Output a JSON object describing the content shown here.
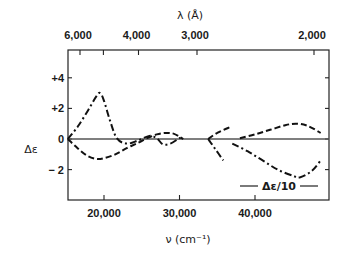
{
  "chart_data": {
    "type": "line",
    "title": "",
    "xlabel": "ν (cm⁻¹)",
    "ylabel": "Δε",
    "top_xlabel": "λ (Å)",
    "xlim": [
      15200,
      49700
    ],
    "ylim": [
      -2.5,
      5.8
    ],
    "grid": false,
    "x_ticks": [
      {
        "value": 20000,
        "label": "20,000"
      },
      {
        "value": 30000,
        "label": "30,000"
      },
      {
        "value": 40000,
        "label": "40,000"
      }
    ],
    "y_ticks": [
      {
        "value": 4,
        "label": "+4"
      },
      {
        "value": 2,
        "label": "+2"
      },
      {
        "value": 0,
        "label": "0"
      },
      {
        "value": -2,
        "label": "− 2"
      }
    ],
    "top_ticks": [
      {
        "lambda": 6000,
        "label": "6,000"
      },
      {
        "lambda": 5000,
        "label": ""
      },
      {
        "lambda": 4000,
        "label": "4,000"
      },
      {
        "lambda": 3000,
        "label": "3,000"
      },
      {
        "lambda": 2000,
        "label": "2,000"
      }
    ],
    "zero_line": true,
    "series": [
      {
        "name": "dash-dot",
        "style": "dashdot",
        "segments": [
          [
            [
              15200,
              0
            ],
            [
              16500,
              0.8
            ],
            [
              17800,
              1.8
            ],
            [
              19000,
              2.8
            ],
            [
              19500,
              3.0
            ],
            [
              20000,
              2.5
            ],
            [
              20800,
              1.2
            ],
            [
              21700,
              0.05
            ],
            [
              23000,
              -0.3
            ],
            [
              24500,
              -0.1
            ],
            [
              26000,
              0.2
            ],
            [
              27000,
              0.05
            ],
            [
              27800,
              -0.35
            ],
            [
              28800,
              -0.3
            ],
            [
              29800,
              0.0
            ],
            [
              30200,
              0.1
            ]
          ],
          [
            [
              33800,
              0
            ],
            [
              34800,
              -0.7
            ],
            [
              35800,
              -1.4
            ]
          ],
          [
            [
              37000,
              -0.3
            ],
            [
              39000,
              -0.8
            ],
            [
              41000,
              -1.4
            ],
            [
              43000,
              -2.0
            ],
            [
              45000,
              -2.4
            ],
            [
              46000,
              -2.5
            ],
            [
              47500,
              -2.1
            ],
            [
              48700,
              -1.4
            ]
          ]
        ]
      },
      {
        "name": "dashed",
        "style": "dashed",
        "segments": [
          [
            [
              15200,
              0
            ],
            [
              16500,
              -0.6
            ],
            [
              17800,
              -1.1
            ],
            [
              19000,
              -1.3
            ],
            [
              20000,
              -1.25
            ],
            [
              21500,
              -1.0
            ],
            [
              23000,
              -0.6
            ],
            [
              24500,
              -0.25
            ],
            [
              25700,
              0.05
            ],
            [
              27000,
              0.3
            ],
            [
              28200,
              0.4
            ],
            [
              29200,
              0.35
            ],
            [
              30000,
              0.15
            ],
            [
              30500,
              0.0
            ]
          ],
          [
            [
              33800,
              0
            ],
            [
              35000,
              0.4
            ],
            [
              36800,
              0.8
            ]
          ],
          [
            [
              38000,
              0.05
            ],
            [
              40000,
              0.3
            ],
            [
              42000,
              0.6
            ],
            [
              44000,
              0.9
            ],
            [
              45500,
              1.0
            ],
            [
              47000,
              0.85
            ],
            [
              48700,
              0.4
            ]
          ]
        ]
      }
    ],
    "legend": {
      "label": "Δε/10",
      "placement": "bottom-right",
      "style": "solid"
    }
  }
}
